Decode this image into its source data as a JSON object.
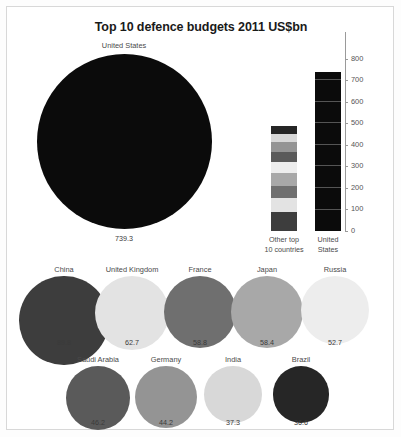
{
  "chart_data": {
    "type": "bar",
    "title": "Top 10 defence budgets 2011 US$bn",
    "xlabel": "",
    "ylabel": "",
    "ylim": [
      0,
      800
    ],
    "ytick_step": 100,
    "yticks": [
      "800",
      "700",
      "600",
      "500",
      "400",
      "300",
      "200",
      "100",
      "0"
    ],
    "grid": false,
    "legend": false,
    "units": "US$bn",
    "year": 2011,
    "bar_categories": [
      "Other top 10 countries",
      "United States"
    ],
    "bar_values": [
      486.7,
      739.3
    ],
    "bar_category_lines": [
      [
        "Other top",
        "10 countries"
      ],
      [
        "United",
        "States"
      ]
    ],
    "stacked_segments": [
      {
        "name": "China",
        "value": 89.8,
        "color": "#3d3d3d"
      },
      {
        "name": "United Kingdom",
        "value": 62.7,
        "color": "#e3e3e3"
      },
      {
        "name": "France",
        "value": 58.8,
        "color": "#6f6f6f"
      },
      {
        "name": "Japan",
        "value": 58.4,
        "color": "#a8a8a8"
      },
      {
        "name": "Russia",
        "value": 52.7,
        "color": "#ededed"
      },
      {
        "name": "Saudi Arabia",
        "value": 46.2,
        "color": "#5a5a5a"
      },
      {
        "name": "Germany",
        "value": 44.2,
        "color": "#949494"
      },
      {
        "name": "India",
        "value": 37.3,
        "color": "#d8d8d8"
      },
      {
        "name": "Brazil",
        "value": 36.6,
        "color": "#262626"
      }
    ],
    "bubbles": [
      {
        "name": "United States",
        "value": 739.3,
        "value_label": "739.3",
        "color": "#0b0b0b",
        "row": 1
      },
      {
        "name": "China",
        "value": 89.8,
        "value_label": "89.8",
        "color": "#3d3d3d",
        "row": 2
      },
      {
        "name": "United Kingdom",
        "value": 62.7,
        "value_label": "62.7",
        "color": "#e3e3e3",
        "row": 2
      },
      {
        "name": "France",
        "value": 58.8,
        "value_label": "58.8",
        "color": "#6f6f6f",
        "row": 2
      },
      {
        "name": "Japan",
        "value": 58.4,
        "value_label": "58.4",
        "color": "#a8a8a8",
        "row": 2
      },
      {
        "name": "Russia",
        "value": 52.7,
        "value_label": "52.7",
        "color": "#ededed",
        "row": 2
      },
      {
        "name": "Saudi Arabia",
        "value": 46.2,
        "value_label": "46.2",
        "color": "#5a5a5a",
        "row": 3
      },
      {
        "name": "Germany",
        "value": 44.2,
        "value_label": "44.2",
        "color": "#949494",
        "row": 3
      },
      {
        "name": "India",
        "value": 37.3,
        "value_label": "37.3",
        "color": "#d8d8d8",
        "row": 3
      },
      {
        "name": "Brazil",
        "value": 36.6,
        "value_label": "36.6",
        "color": "#262626",
        "row": 3
      }
    ]
  },
  "bubbles": {
    "us": {
      "label": "United States",
      "value": "739.3"
    },
    "row2": [
      {
        "label": "China",
        "value": "89.8"
      },
      {
        "label": "United Kingdom",
        "value": "62.7"
      },
      {
        "label": "France",
        "value": "58.8"
      },
      {
        "label": "Japan",
        "value": "58.4"
      },
      {
        "label": "Russia",
        "value": "52.7"
      }
    ],
    "row3": [
      {
        "label": "Saudi Arabia",
        "value": "46.2"
      },
      {
        "label": "Germany",
        "value": "44.2"
      },
      {
        "label": "India",
        "value": "37.3"
      },
      {
        "label": "Brazil",
        "value": "36.6"
      }
    ]
  },
  "bars": {
    "axis_labels": [
      "800",
      "700",
      "600",
      "500",
      "400",
      "300",
      "200",
      "100",
      "0"
    ],
    "cat_other_line1": "Other top",
    "cat_other_line2": "10 countries",
    "cat_us_line1": "United",
    "cat_us_line2": "States"
  },
  "header": {
    "title": "Top 10 defence budgets 2011 US$bn"
  }
}
